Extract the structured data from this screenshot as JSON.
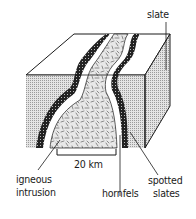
{
  "labels": {
    "slate": "slate",
    "scale": "20 km",
    "igneous_1": "igneous",
    "igneous_2": "intrusion",
    "hornfels": "hornfels",
    "spotted_1": "spotted",
    "spotted_2": "slates"
  },
  "colors": {
    "line": "#1a1a1a",
    "slate_fill": "#c8c8c8",
    "intrusion_fill": "#bdbdbd",
    "spotted_fill": "#2a2a2a"
  }
}
